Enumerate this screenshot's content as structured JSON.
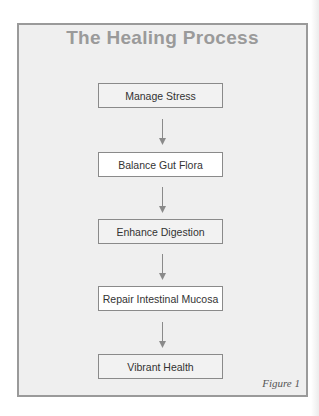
{
  "diagram": {
    "title": "The Healing Process",
    "steps": [
      {
        "label": "Manage Stress"
      },
      {
        "label": "Balance Gut Flora"
      },
      {
        "label": "Enhance Digestion"
      },
      {
        "label": "Repair Intestinal Mucosa"
      },
      {
        "label": "Vibrant Health"
      }
    ],
    "figure_label": "Figure 1",
    "colors": {
      "title": "#9a9a9a",
      "panel_bg": "#efefef",
      "border": "#9a9a9a",
      "arrow": "#8a8a8a"
    }
  }
}
